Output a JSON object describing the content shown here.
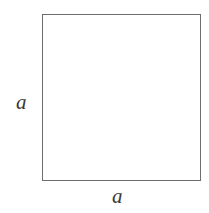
{
  "figure": {
    "shape": "square",
    "outline_color": "#6e6e6e",
    "background_color": "#ffffff",
    "label_color": "#3a3a3a",
    "left_side_label": "a",
    "bottom_side_label": "a"
  }
}
